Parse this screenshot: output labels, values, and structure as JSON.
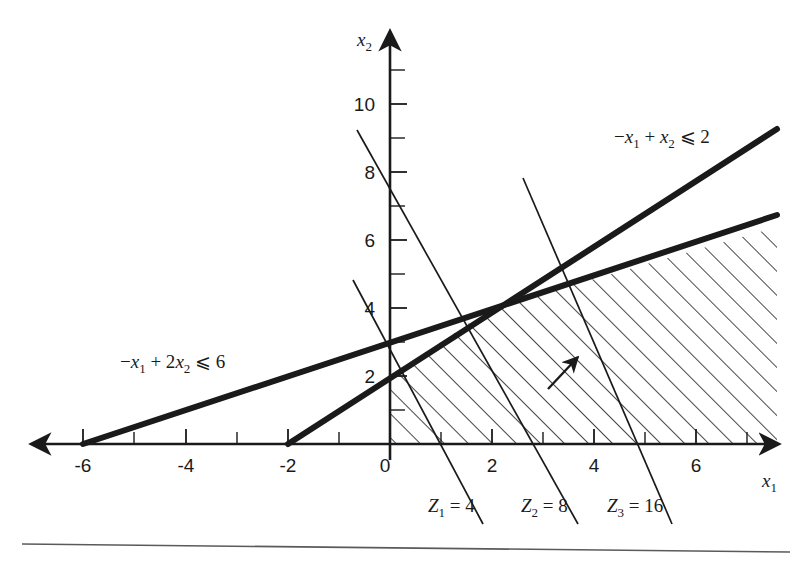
{
  "figure": {
    "background_color": "#ffffff",
    "ink_color": "#1a1a1a",
    "axes": {
      "x_axis_name": "x",
      "x_axis_sub": "1",
      "y_axis_name": "x",
      "y_axis_sub": "2",
      "x_tick_labels": [
        "-6",
        "-4",
        "-2",
        "0",
        "2",
        "4",
        "6"
      ],
      "x_tick_values": [
        -6,
        -4,
        -2,
        0,
        2,
        4,
        6
      ],
      "x_minor_ticks": [
        -7,
        -5,
        -3,
        -1,
        1,
        3,
        5,
        7
      ],
      "y_tick_labels": [
        "2",
        "4",
        "6",
        "8",
        "10"
      ],
      "y_tick_values": [
        2,
        4,
        6,
        8,
        10
      ],
      "y_minor_ticks": [
        1,
        3,
        5,
        7,
        9,
        11
      ],
      "x_range": [
        -7.6,
        7.9
      ],
      "y_range": [
        -0.6,
        12.2
      ],
      "origin_label": "0"
    },
    "constraints": [
      {
        "id": "c1",
        "label_prefix": "−",
        "label": "−x₁ + 2x₂ ⩽ 6",
        "label_parts": {
          "neg": "−",
          "v1": "x",
          "s1": "1",
          "plus": " + 2",
          "v2": "x",
          "s2": "2",
          "rel": " ⩽ 6"
        },
        "a": -1,
        "b": 2,
        "rhs": 6,
        "x_intercept": -6,
        "y_intercept": 3,
        "label_x": 120,
        "label_y": 368
      },
      {
        "id": "c2",
        "label": "−x₁ + x₂ ⩽ 2",
        "label_parts": {
          "neg": "−",
          "v1": "x",
          "s1": "1",
          "plus": " + ",
          "v2": "x",
          "s2": "2",
          "rel": " ⩽ 2"
        },
        "a": -1,
        "b": 1,
        "rhs": 2,
        "x_intercept": -2,
        "y_intercept": 2,
        "label_x": 614,
        "label_y": 143
      }
    ],
    "objective_lines": [
      {
        "id": "z1",
        "label": "Z₁ = 4",
        "name": "Z",
        "sub": "1",
        "value": "4",
        "x_intercept": 1,
        "y_intercept": 4,
        "label_x": 428,
        "label_y": 510
      },
      {
        "id": "z2",
        "label": "Z₂ = 8",
        "name": "Z",
        "sub": "2",
        "value": "8",
        "x_intercept": 2,
        "y_intercept": 8,
        "label_x": 522,
        "label_y": 510
      },
      {
        "id": "z3",
        "label": "Z₃ = 16",
        "name": "Z",
        "sub": "3",
        "value": "16",
        "x_intercept": 4,
        "y_intercept": 16,
        "label_x": 607,
        "label_y": 510
      }
    ],
    "feasible_region": {
      "hatch_angle_deg": 45,
      "hatch_spacing_px": 17,
      "description": "shaded region"
    },
    "direction_arrow": {
      "name": "increasing-z-arrow",
      "from_x": 551,
      "from_y": 385,
      "to_x": 578,
      "to_y": 358
    },
    "vertex": {
      "x": 2,
      "y": 4
    },
    "footer_rule": true
  }
}
